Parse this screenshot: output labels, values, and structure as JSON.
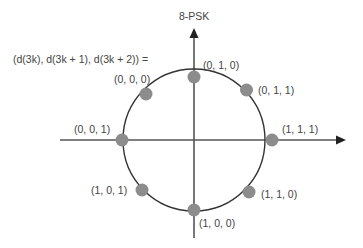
{
  "title": "8-PSK",
  "mapping_label": "(d(3k), d(3k + 1), d(3k + 2)) =",
  "colors": {
    "axis": "#555555",
    "circle": "#333333",
    "dot": "#8c8c8c",
    "text": "#444444",
    "arrow": "#222222"
  },
  "points": [
    {
      "label": "(0, 1, 0)",
      "angle_deg": 90
    },
    {
      "label": "(0, 1, 1)",
      "angle_deg": 45
    },
    {
      "label": "(1, 1, 1)",
      "angle_deg": 0
    },
    {
      "label": "(1, 1, 0)",
      "angle_deg": -45
    },
    {
      "label": "(1, 0, 0)",
      "angle_deg": -90
    },
    {
      "label": "(1, 0, 1)",
      "angle_deg": -135
    },
    {
      "label": "(0, 0, 1)",
      "angle_deg": 180
    },
    {
      "label": "(0, 0, 0)",
      "angle_deg": 135
    }
  ]
}
